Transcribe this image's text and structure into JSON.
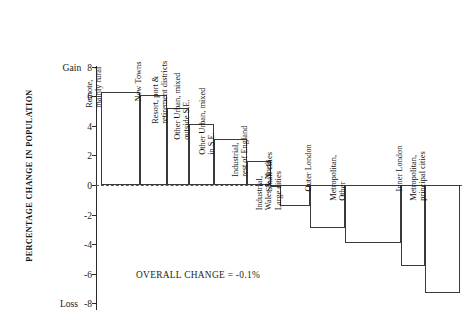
{
  "chart_data": {
    "type": "bar",
    "title": "",
    "subtitle": "",
    "xlabel": "",
    "ylabel": "PERCENTAGE CHANGE IN POPULATION",
    "ylim": [
      -8,
      8
    ],
    "ytick_values": [
      8,
      6,
      4,
      2,
      0,
      -2,
      -4,
      -6,
      -8
    ],
    "ytick_labels": [
      "8",
      "6",
      "4",
      "2",
      "0",
      "-2",
      "-4",
      "-6",
      "-8"
    ],
    "top_axis_word": "Gain",
    "bottom_axis_word": "Loss",
    "grid": false,
    "legend": "none",
    "zero_reference_line": true,
    "categories": [
      "Remote,\nmainly rural",
      "New Towns",
      "Resort, port &\nretirement districts",
      "Other Urban, mixed\noutside S.E.",
      "Other Urban, mixed\nin S.E.",
      "Industrial,\nrest of England",
      "Small cities",
      "Industrial,\nWales & North\nLarge cities",
      "Outer London",
      "Metropolitan,\nOther",
      "Inner London",
      "Metropolitan,\nprincipal cities"
    ],
    "values": [
      6.3,
      6.1,
      5.2,
      4.1,
      3.1,
      1.6,
      -0.15,
      -1.4,
      -2.9,
      -3.9,
      -5.5,
      -7.3
    ],
    "annotations": [
      {
        "text": "OVERALL CHANGE = -0.1%",
        "value": -0.1
      }
    ]
  },
  "axis": {
    "gain_label": "Gain",
    "loss_label": "Loss",
    "title": "PERCENTAGE CHANGE IN POPULATION"
  },
  "note": {
    "overall_change": "OVERALL CHANGE = -0.1%"
  }
}
